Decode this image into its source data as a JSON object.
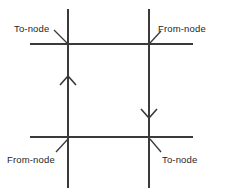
{
  "diagram": {
    "type": "line-direction-annotation-diagram",
    "canvas": {
      "width": 231,
      "height": 195,
      "background": "#ffffff"
    },
    "stroke_color": "#3a3a3a",
    "text_color": "#262626",
    "labels": [
      {
        "id": "top-left",
        "text": "To-node",
        "text_x": 14,
        "text_y": 32,
        "anchor": "start",
        "leader": {
          "x1": 54,
          "y1": 30,
          "x2": 67,
          "y2": 43
        }
      },
      {
        "id": "top-right",
        "text": "From-node",
        "text_x": 158,
        "text_y": 32,
        "anchor": "start",
        "leader": {
          "x1": 150,
          "y1": 43,
          "x2": 161,
          "y2": 31
        }
      },
      {
        "id": "bottom-left",
        "text": "From-node",
        "text_x": 7,
        "text_y": 163,
        "anchor": "start",
        "leader": {
          "x1": 56,
          "y1": 152,
          "x2": 68,
          "y2": 139
        }
      },
      {
        "id": "bottom-right",
        "text": "To-node",
        "text_x": 162,
        "text_y": 163,
        "anchor": "start",
        "leader": {
          "x1": 150,
          "y1": 139,
          "x2": 161,
          "y2": 152
        }
      }
    ],
    "vertical_lines": [
      {
        "id": "left-vertical",
        "x": 68,
        "y1": 9,
        "y2": 188,
        "direction": "up",
        "arrow_y": 82
      },
      {
        "id": "right-vertical",
        "x": 149,
        "y1": 9,
        "y2": 188,
        "direction": "down",
        "arrow_y": 112
      }
    ],
    "horizontal_lines": [
      {
        "id": "top-horizontal",
        "y": 44,
        "x1": 30,
        "x2": 193
      },
      {
        "id": "bottom-horizontal",
        "y": 137,
        "x1": 30,
        "x2": 193
      }
    ],
    "arrowheads": [
      {
        "id": "up-arrowhead",
        "tip_x": 68,
        "tip_y": 76,
        "wing": 8,
        "direction": "up"
      },
      {
        "id": "down-arrowhead",
        "tip_x": 149,
        "tip_y": 118,
        "wing": 8,
        "direction": "down"
      }
    ]
  }
}
